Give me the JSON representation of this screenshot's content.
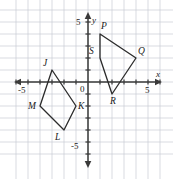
{
  "figure": {
    "background": "#ffffff",
    "grid_color": "#c9ccd4",
    "axis_color": "#3a3a3a",
    "shape_color": "#2b2b2b",
    "label_color": "#1a1a1a"
  },
  "axes": {
    "x_axis_label": "x",
    "y_axis_label": "y",
    "origin_label": "0",
    "x_min": -6,
    "x_max": 6,
    "y_min": -6,
    "y_max": 6,
    "unit_px": 12,
    "origin_px": {
      "x": 88,
      "y": 82
    },
    "ticks": [
      {
        "name": "x-neg-5",
        "text": "-5",
        "axis": "x",
        "value": -5
      },
      {
        "name": "x-pos-5",
        "text": "5",
        "axis": "x",
        "value": 5
      },
      {
        "name": "y-pos-5",
        "text": "5",
        "axis": "y",
        "value": 5
      },
      {
        "name": "y-neg-5",
        "text": "-5",
        "axis": "y",
        "value": -5
      }
    ]
  },
  "chart_data": {
    "type": "scatter",
    "xlabel": "x",
    "ylabel": "y",
    "xlim": [
      -6,
      6
    ],
    "ylim": [
      -6,
      6
    ],
    "grid": true,
    "legend": "none",
    "series": [
      {
        "name": "JKLM",
        "closed": true,
        "points": [
          {
            "label": "J",
            "x": -3,
            "y": 1
          },
          {
            "label": "K",
            "x": -1,
            "y": -2
          },
          {
            "label": "L",
            "x": -2,
            "y": -4
          },
          {
            "label": "M",
            "x": -4,
            "y": -2
          }
        ]
      },
      {
        "name": "PQRS",
        "closed": true,
        "points": [
          {
            "label": "P",
            "x": 1,
            "y": 4
          },
          {
            "label": "Q",
            "x": 4,
            "y": 2
          },
          {
            "label": "R",
            "x": 2,
            "y": -1
          },
          {
            "label": "S",
            "x": 1,
            "y": 2
          }
        ]
      }
    ]
  },
  "vertex_labels": [
    {
      "name": "vertex-label-J",
      "text": "J",
      "x": -3,
      "y": 1,
      "dx": -9,
      "dy": -11
    },
    {
      "name": "vertex-label-K",
      "text": "K",
      "x": -1,
      "y": -2,
      "dx": 2,
      "dy": -4
    },
    {
      "name": "vertex-label-L",
      "text": "L",
      "x": -2,
      "y": -4,
      "dx": -9,
      "dy": 3
    },
    {
      "name": "vertex-label-M",
      "text": "M",
      "x": -4,
      "y": -2,
      "dx": -12,
      "dy": -4
    },
    {
      "name": "vertex-label-P",
      "text": "P",
      "x": 1,
      "y": 4,
      "dx": 1,
      "dy": -12
    },
    {
      "name": "vertex-label-Q",
      "text": "Q",
      "x": 4,
      "y": 2,
      "dx": 2,
      "dy": -11
    },
    {
      "name": "vertex-label-R",
      "text": "R",
      "x": 2,
      "y": -1,
      "dx": -2,
      "dy": 3
    },
    {
      "name": "vertex-label-S",
      "text": "S",
      "x": 1,
      "y": 2,
      "dx": -11,
      "dy": -11
    }
  ],
  "axis_text": {
    "x_label": {
      "name": "x-axis-label",
      "text": "x",
      "px": 156,
      "py": 70
    },
    "y_label": {
      "name": "y-axis-label",
      "text": "y",
      "px": 92,
      "py": 16
    },
    "origin": {
      "name": "origin-label",
      "text": "0",
      "px": 80,
      "py": 85
    },
    "x_neg5": {
      "name": "x-tick-neg5-label",
      "text": "-5",
      "px": 18,
      "py": 86
    },
    "x_pos5": {
      "name": "x-tick-pos5-label",
      "text": "5",
      "px": 145,
      "py": 86
    },
    "y_pos5": {
      "name": "y-tick-pos5-label",
      "text": "5",
      "px": 76,
      "py": 18
    },
    "y_neg5": {
      "name": "y-tick-neg5-label",
      "text": "-5",
      "px": 71,
      "py": 142
    }
  }
}
